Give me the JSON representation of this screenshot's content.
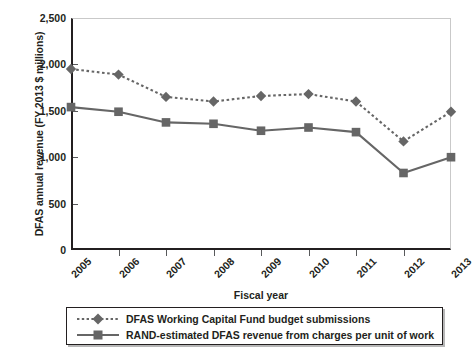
{
  "chart_data": {
    "type": "line",
    "title": "",
    "xlabel": "Fiscal year",
    "ylabel": "DFAS annual revenue (FY 2013 $ millions)",
    "categories": [
      "2005",
      "2006",
      "2007",
      "2008",
      "2009",
      "2010",
      "2011",
      "2012",
      "2013"
    ],
    "x": [
      2005,
      2006,
      2007,
      2008,
      2009,
      2010,
      2011,
      2012,
      2013
    ],
    "ylim": [
      0,
      2500
    ],
    "yticks": [
      0,
      500,
      1000,
      1500,
      2000,
      2500
    ],
    "ytick_labels": [
      "0",
      "500",
      "1,000",
      "1,500",
      "2,000",
      "2,500"
    ],
    "grid": false,
    "legend_position": "below-axes",
    "series": [
      {
        "name": "DFAS Working Capital Fund budget submissions",
        "marker": "diamond",
        "linestyle": "dotted",
        "color": "#666666",
        "values": [
          1950,
          1890,
          1650,
          1600,
          1660,
          1680,
          1600,
          1170,
          1490
        ]
      },
      {
        "name": "RAND-estimated DFAS revenue from charges per unit of work",
        "marker": "square",
        "linestyle": "solid",
        "color": "#666666",
        "values": [
          1540,
          1490,
          1375,
          1360,
          1285,
          1320,
          1270,
          830,
          1000
        ]
      }
    ]
  },
  "legend": {
    "entries": [
      "DFAS Working Capital Fund budget submissions",
      "RAND-estimated DFAS revenue from charges per unit of work"
    ]
  },
  "colors": {
    "series": "#666666",
    "axis": "#231f20",
    "frame_light": "#c9c9c9",
    "background": "#ffffff"
  }
}
